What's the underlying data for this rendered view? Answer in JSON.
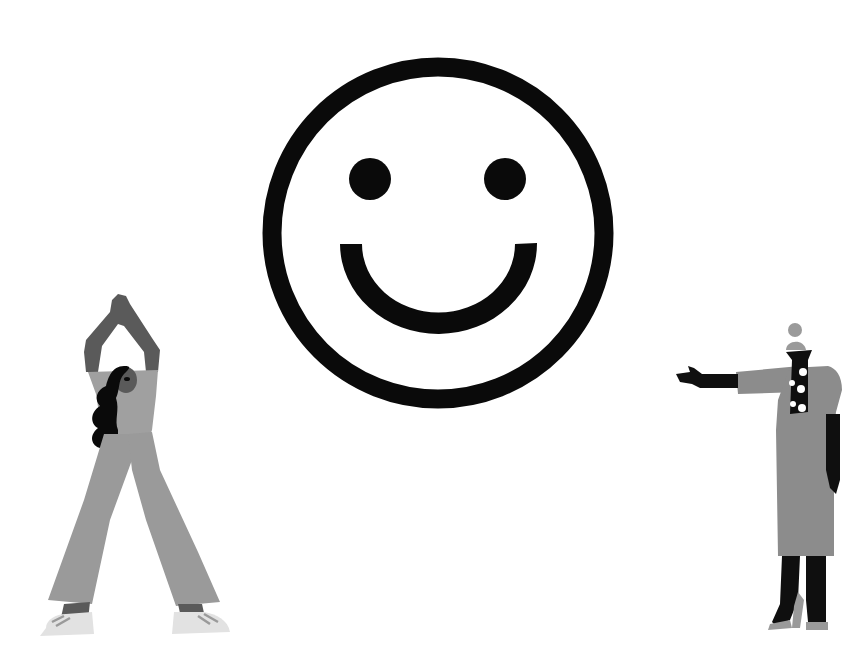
{
  "scene": {
    "description": "Illustration: large smiley face with two people, one stretching and one pointing",
    "background": "#ffffff"
  },
  "smiley": {
    "icon": "smiley-face-icon",
    "center": [
      438,
      233
    ],
    "radius": 168,
    "stroke_width": 19,
    "color": "#0a0a0a"
  },
  "figures": [
    {
      "id": "woman-stretching",
      "pose": "arms raised overhead, hands clasped",
      "colors": {
        "skin": "#5a5a5a",
        "hair": "#0a0a0a",
        "jumpsuit": "#9a9a9a",
        "shoes": "#e2e2e2"
      }
    },
    {
      "id": "woman-pointing",
      "pose": "pointing left with outstretched arm",
      "colors": {
        "skin": "#0f0f0f",
        "dress": "#8c8c8c",
        "scarf": "#0f0f0f",
        "scarf_dots": "#ffffff",
        "hat": "#9a9a9a",
        "heels": "#9a9a9a"
      }
    }
  ]
}
